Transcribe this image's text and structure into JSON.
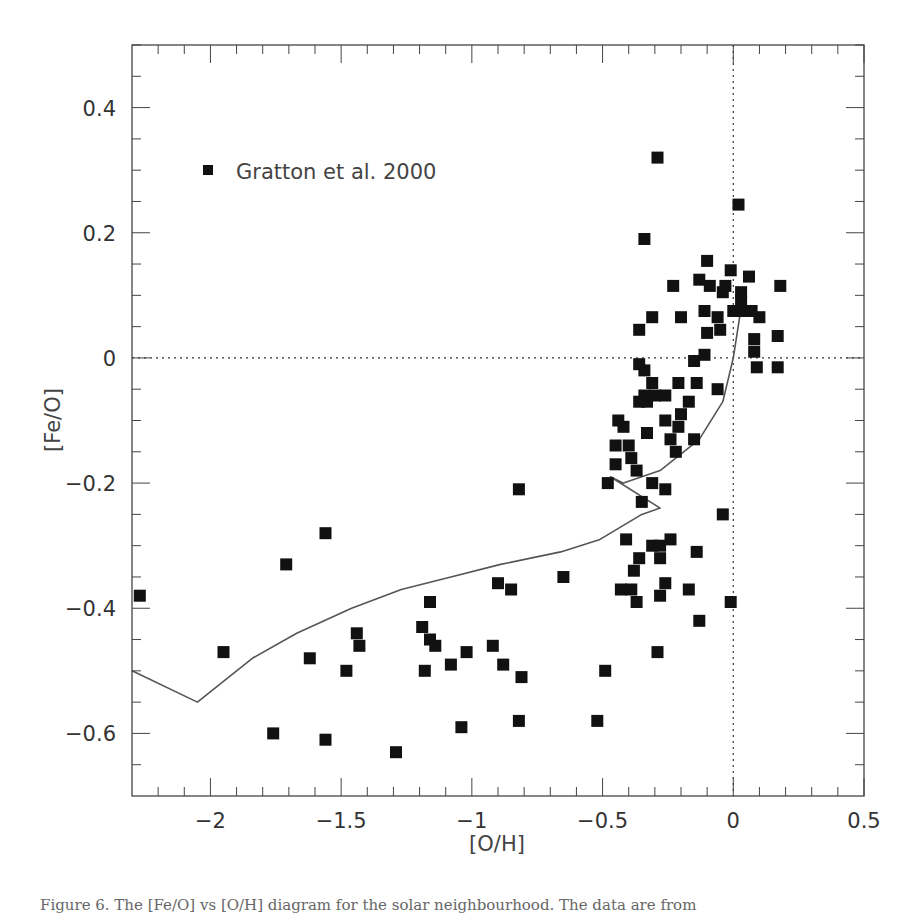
{
  "chart_data": {
    "type": "scatter",
    "title": "",
    "xlabel": "[O/H]",
    "ylabel": "[Fe/O]",
    "xlim": [
      -2.3,
      0.5
    ],
    "ylim": [
      -0.7,
      0.5
    ],
    "grid": false,
    "x_ticks": [
      -2,
      -1.5,
      -1,
      -0.5,
      0,
      0.5
    ],
    "x_tick_labels": [
      "−2",
      "−1.5",
      "−1",
      "−0.5",
      "0",
      "0.5"
    ],
    "x_minor_step": 0.1,
    "y_ticks": [
      -0.6,
      -0.4,
      -0.2,
      0,
      0.2,
      0.4
    ],
    "y_tick_labels": [
      "−0.6",
      "−0.4",
      "−0.2",
      "0",
      "0.2",
      "0.4"
    ],
    "y_minor_step": 0.05,
    "reference_lines": [
      {
        "orientation": "horizontal",
        "value": 0,
        "style": "dotted"
      },
      {
        "orientation": "vertical",
        "value": 0,
        "style": "dotted"
      }
    ],
    "legend": {
      "position": "upper-left",
      "entries": [
        {
          "marker": "filled-square",
          "label": "Gratton et al. 2000"
        }
      ]
    },
    "series": [
      {
        "name": "Gratton et al. 2000",
        "kind": "scatter",
        "marker": "filled-square",
        "points": [
          [
            -2.27,
            -0.38
          ],
          [
            -1.95,
            -0.47
          ],
          [
            -1.71,
            -0.33
          ],
          [
            -1.56,
            -0.28
          ],
          [
            -1.62,
            -0.48
          ],
          [
            -1.44,
            -0.44
          ],
          [
            -1.43,
            -0.46
          ],
          [
            -1.48,
            -0.5
          ],
          [
            -1.76,
            -0.6
          ],
          [
            -1.56,
            -0.61
          ],
          [
            -1.29,
            -0.63
          ],
          [
            -1.16,
            -0.39
          ],
          [
            -1.19,
            -0.43
          ],
          [
            -1.16,
            -0.45
          ],
          [
            -1.14,
            -0.46
          ],
          [
            -1.18,
            -0.5
          ],
          [
            -1.08,
            -0.49
          ],
          [
            -1.02,
            -0.47
          ],
          [
            -1.04,
            -0.59
          ],
          [
            -0.92,
            -0.46
          ],
          [
            -0.88,
            -0.49
          ],
          [
            -0.81,
            -0.51
          ],
          [
            -0.82,
            -0.58
          ],
          [
            -0.9,
            -0.36
          ],
          [
            -0.85,
            -0.37
          ],
          [
            -0.82,
            -0.21
          ],
          [
            -0.65,
            -0.35
          ],
          [
            -0.52,
            -0.58
          ],
          [
            -0.49,
            -0.5
          ],
          [
            -0.48,
            -0.2
          ],
          [
            -0.43,
            -0.37
          ],
          [
            -0.39,
            -0.37
          ],
          [
            -0.41,
            -0.29
          ],
          [
            -0.38,
            -0.34
          ],
          [
            -0.36,
            -0.32
          ],
          [
            -0.37,
            -0.39
          ],
          [
            -0.31,
            -0.3
          ],
          [
            -0.28,
            -0.3
          ],
          [
            -0.28,
            -0.32
          ],
          [
            -0.24,
            -0.29
          ],
          [
            -0.26,
            -0.36
          ],
          [
            -0.28,
            -0.38
          ],
          [
            -0.29,
            -0.47
          ],
          [
            -0.17,
            -0.37
          ],
          [
            -0.14,
            -0.31
          ],
          [
            -0.13,
            -0.42
          ],
          [
            -0.04,
            -0.25
          ],
          [
            -0.01,
            -0.39
          ],
          [
            -0.35,
            -0.23
          ],
          [
            -0.26,
            -0.21
          ],
          [
            -0.31,
            -0.2
          ],
          [
            -0.37,
            -0.18
          ],
          [
            -0.45,
            -0.17
          ],
          [
            -0.39,
            -0.16
          ],
          [
            -0.45,
            -0.14
          ],
          [
            -0.4,
            -0.14
          ],
          [
            -0.33,
            -0.12
          ],
          [
            -0.22,
            -0.15
          ],
          [
            -0.24,
            -0.13
          ],
          [
            -0.15,
            -0.13
          ],
          [
            -0.21,
            -0.11
          ],
          [
            -0.44,
            -0.1
          ],
          [
            -0.42,
            -0.11
          ],
          [
            -0.26,
            -0.1
          ],
          [
            -0.2,
            -0.09
          ],
          [
            -0.36,
            -0.07
          ],
          [
            -0.33,
            -0.07
          ],
          [
            -0.17,
            -0.07
          ],
          [
            -0.34,
            -0.06
          ],
          [
            -0.3,
            -0.06
          ],
          [
            -0.26,
            -0.06
          ],
          [
            -0.31,
            -0.04
          ],
          [
            -0.21,
            -0.04
          ],
          [
            -0.14,
            -0.04
          ],
          [
            -0.06,
            -0.05
          ],
          [
            -0.36,
            -0.01
          ],
          [
            -0.34,
            -0.02
          ],
          [
            -0.15,
            -0.005
          ],
          [
            -0.11,
            0.005
          ],
          [
            0.09,
            -0.015
          ],
          [
            0.17,
            -0.015
          ],
          [
            0.08,
            0.01
          ],
          [
            0.08,
            0.03
          ],
          [
            0.17,
            0.035
          ],
          [
            -0.1,
            0.04
          ],
          [
            -0.05,
            0.045
          ],
          [
            -0.36,
            0.045
          ],
          [
            -0.31,
            0.065
          ],
          [
            -0.2,
            0.065
          ],
          [
            -0.06,
            0.065
          ],
          [
            0.1,
            0.065
          ],
          [
            -0.11,
            0.075
          ],
          [
            0.0,
            0.075
          ],
          [
            0.04,
            0.075
          ],
          [
            0.07,
            0.075
          ],
          [
            0.03,
            0.09
          ],
          [
            -0.04,
            0.105
          ],
          [
            0.03,
            0.105
          ],
          [
            -0.23,
            0.115
          ],
          [
            -0.09,
            0.115
          ],
          [
            -0.03,
            0.115
          ],
          [
            0.18,
            0.115
          ],
          [
            -0.13,
            0.125
          ],
          [
            0.06,
            0.13
          ],
          [
            -0.01,
            0.14
          ],
          [
            -0.1,
            0.155
          ],
          [
            -0.34,
            0.19
          ],
          [
            0.02,
            0.245
          ],
          [
            -0.29,
            0.32
          ]
        ]
      },
      {
        "name": "model",
        "kind": "line",
        "points": [
          [
            -2.3,
            -0.5
          ],
          [
            -2.05,
            -0.55
          ],
          [
            -1.84,
            -0.48
          ],
          [
            -1.67,
            -0.44
          ],
          [
            -1.46,
            -0.4
          ],
          [
            -1.27,
            -0.37
          ],
          [
            -1.08,
            -0.35
          ],
          [
            -0.89,
            -0.33
          ],
          [
            -0.66,
            -0.31
          ],
          [
            -0.51,
            -0.29
          ],
          [
            -0.35,
            -0.25
          ],
          [
            -0.28,
            -0.24
          ],
          [
            -0.47,
            -0.19
          ],
          [
            -0.42,
            -0.2
          ],
          [
            -0.28,
            -0.18
          ],
          [
            -0.13,
            -0.13
          ],
          [
            -0.04,
            -0.07
          ],
          [
            0.0,
            0.0
          ],
          [
            0.03,
            0.08
          ]
        ]
      }
    ]
  },
  "caption": {
    "partial_text": "Figure 6. The [Fe/O] vs [O/H] diagram for the solar neighbourhood. The data are from"
  }
}
